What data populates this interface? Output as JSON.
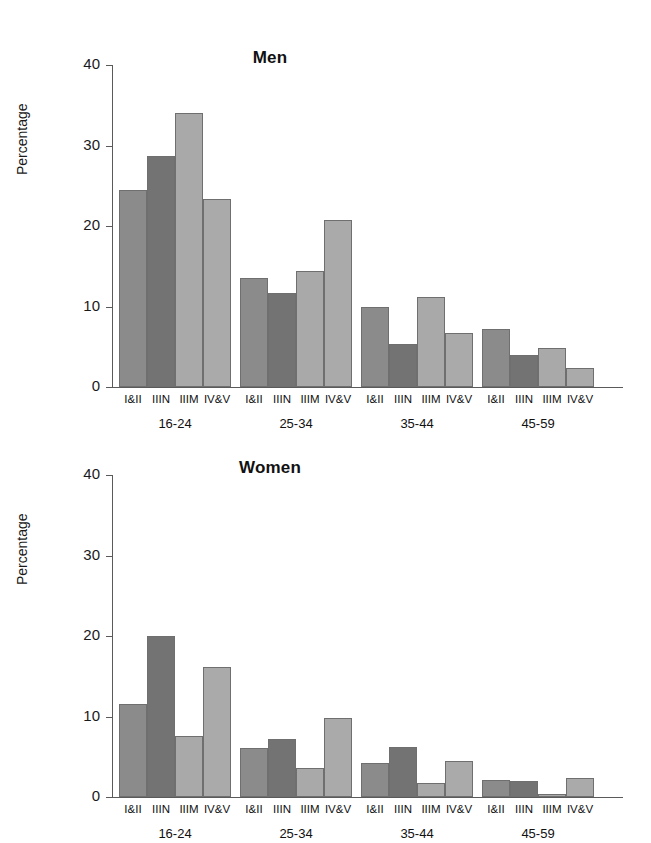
{
  "chart_data": [
    {
      "type": "bar",
      "title": "Men",
      "xlabel": "",
      "ylabel": "Percentage",
      "ylim": [
        0,
        40
      ],
      "yticks": [
        0,
        10,
        20,
        30,
        40
      ],
      "grid": false,
      "legend": "none",
      "categories": [
        "I&II",
        "IIIN",
        "IIIM",
        "IV&V"
      ],
      "groups": [
        "16-24",
        "25-34",
        "35-44",
        "45-59"
      ],
      "series": [
        {
          "name": "16-24",
          "values": [
            24.5,
            28.7,
            34.0,
            23.4
          ]
        },
        {
          "name": "25-34",
          "values": [
            13.5,
            11.7,
            14.4,
            20.8
          ]
        },
        {
          "name": "35-44",
          "values": [
            9.9,
            5.3,
            11.2,
            6.7
          ]
        },
        {
          "name": "45-59",
          "values": [
            7.2,
            4.0,
            4.8,
            2.4
          ]
        }
      ]
    },
    {
      "type": "bar",
      "title": "Women",
      "xlabel": "",
      "ylabel": "Percentage",
      "ylim": [
        0,
        40
      ],
      "yticks": [
        0,
        10,
        20,
        30,
        40
      ],
      "grid": false,
      "legend": "none",
      "categories": [
        "I&II",
        "IIIN",
        "IIIM",
        "IV&V"
      ],
      "groups": [
        "16-24",
        "25-34",
        "35-44",
        "45-59"
      ],
      "series": [
        {
          "name": "16-24",
          "values": [
            11.5,
            20.0,
            7.6,
            16.2
          ]
        },
        {
          "name": "25-34",
          "values": [
            6.1,
            7.2,
            3.6,
            9.8
          ]
        },
        {
          "name": "35-44",
          "values": [
            4.2,
            6.2,
            1.8,
            4.5
          ]
        },
        {
          "name": "45-59",
          "values": [
            2.1,
            2.0,
            0.4,
            2.4
          ]
        }
      ]
    }
  ],
  "men": {
    "title": "Men",
    "ylabel": "Percentage",
    "yticks": [
      "40",
      "30",
      "20",
      "10",
      "0"
    ],
    "groups": [
      {
        "label": "16-24",
        "bars": [
          {
            "cat": "I&II",
            "value": 24.5
          },
          {
            "cat": "IIIN",
            "value": 28.7
          },
          {
            "cat": "IIIM",
            "value": 34.0
          },
          {
            "cat": "IV&V",
            "value": 23.4
          }
        ]
      },
      {
        "label": "25-34",
        "bars": [
          {
            "cat": "I&II",
            "value": 13.5
          },
          {
            "cat": "IIIN",
            "value": 11.7
          },
          {
            "cat": "IIIM",
            "value": 14.4
          },
          {
            "cat": "IV&V",
            "value": 20.8
          }
        ]
      },
      {
        "label": "35-44",
        "bars": [
          {
            "cat": "I&II",
            "value": 9.9
          },
          {
            "cat": "IIIN",
            "value": 5.3
          },
          {
            "cat": "IIIM",
            "value": 11.2
          },
          {
            "cat": "IV&V",
            "value": 6.7
          }
        ]
      },
      {
        "label": "45-59",
        "bars": [
          {
            "cat": "I&II",
            "value": 7.2
          },
          {
            "cat": "IIIN",
            "value": 4.0
          },
          {
            "cat": "IIIM",
            "value": 4.8
          },
          {
            "cat": "IV&V",
            "value": 2.4
          }
        ]
      }
    ]
  },
  "women": {
    "title": "Women",
    "ylabel": "Percentage",
    "yticks": [
      "40",
      "30",
      "20",
      "10",
      "0"
    ],
    "groups": [
      {
        "label": "16-24",
        "bars": [
          {
            "cat": "I&II",
            "value": 11.5
          },
          {
            "cat": "IIIN",
            "value": 20.0
          },
          {
            "cat": "IIIM",
            "value": 7.6
          },
          {
            "cat": "IV&V",
            "value": 16.2
          }
        ]
      },
      {
        "label": "25-34",
        "bars": [
          {
            "cat": "I&II",
            "value": 6.1
          },
          {
            "cat": "IIIN",
            "value": 7.2
          },
          {
            "cat": "IIIM",
            "value": 3.6
          },
          {
            "cat": "IV&V",
            "value": 9.8
          }
        ]
      },
      {
        "label": "35-44",
        "bars": [
          {
            "cat": "I&II",
            "value": 4.2
          },
          {
            "cat": "IIIN",
            "value": 6.2
          },
          {
            "cat": "IIIM",
            "value": 1.8
          },
          {
            "cat": "IV&V",
            "value": 4.5
          }
        ]
      },
      {
        "label": "45-59",
        "bars": [
          {
            "cat": "I&II",
            "value": 2.1
          },
          {
            "cat": "IIIN",
            "value": 2.0
          },
          {
            "cat": "IIIM",
            "value": 0.4
          },
          {
            "cat": "IV&V",
            "value": 2.4
          }
        ]
      }
    ]
  },
  "style": {
    "bar_colors": [
      "#8b8b8b",
      "#737373",
      "#a9a9a9",
      "#aaaaaa"
    ],
    "bar_border": "#6f6f6f",
    "axis_color": "#5a5a5a",
    "text_color": "#111111",
    "background": "#ffffff"
  }
}
